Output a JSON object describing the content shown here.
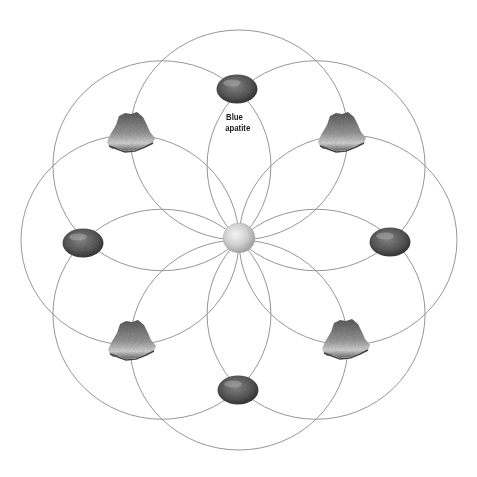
{
  "diagram": {
    "type": "crystal-grid-flower-of-life",
    "center": {
      "x": 239,
      "y": 240
    },
    "circle_radius_x": 109,
    "circle_radius_y": 105,
    "circle_count": 8,
    "line_color": "#8a8a8a",
    "center_stone": {
      "name": "center-sphere",
      "x": 239,
      "y": 238,
      "rx": 16,
      "ry": 15,
      "color": "#d4d4d4"
    },
    "tumbled_stones": [
      {
        "position": "top",
        "x": 237,
        "y": 89,
        "label": "Blue apatite"
      },
      {
        "position": "left",
        "x": 83,
        "y": 243
      },
      {
        "position": "right",
        "x": 390,
        "y": 242
      },
      {
        "position": "bottom",
        "x": 238,
        "y": 390
      }
    ],
    "crystal_clusters": [
      {
        "position": "top-left",
        "x": 131,
        "y": 133
      },
      {
        "position": "top-right",
        "x": 342,
        "y": 133
      },
      {
        "position": "bottom-left",
        "x": 132,
        "y": 341
      },
      {
        "position": "bottom-right",
        "x": 346,
        "y": 340
      }
    ]
  },
  "labels": {
    "top_stone_line1": "Blue",
    "top_stone_line2": "apatite"
  }
}
